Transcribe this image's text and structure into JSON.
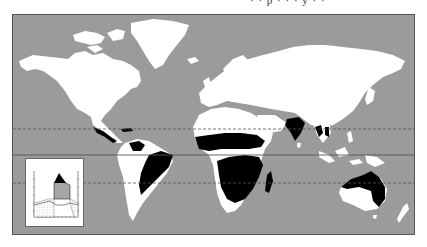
{
  "caption": "· · p · · · y · ·",
  "map": {
    "ocean_color": "#9b9b9b",
    "land_color": "#ffffff",
    "highlight_color": "#000000",
    "reference_lines": [
      {
        "name": "tropic-of-cancer",
        "style": "dashed"
      },
      {
        "name": "equator",
        "style": "solid"
      },
      {
        "name": "tropic-of-capricorn",
        "style": "dashed"
      }
    ],
    "highlighted_regions": [
      "central-america-pacific-coast",
      "northern-venezuela-colombia",
      "brazil-cerrado",
      "sahel-sudan-savanna",
      "east-africa-savanna",
      "southern-africa-savanna",
      "madagascar-west",
      "india",
      "indochina",
      "northern-australia"
    ]
  },
  "inset": {
    "title": "climate-diagram",
    "type": "walter-lieth"
  }
}
